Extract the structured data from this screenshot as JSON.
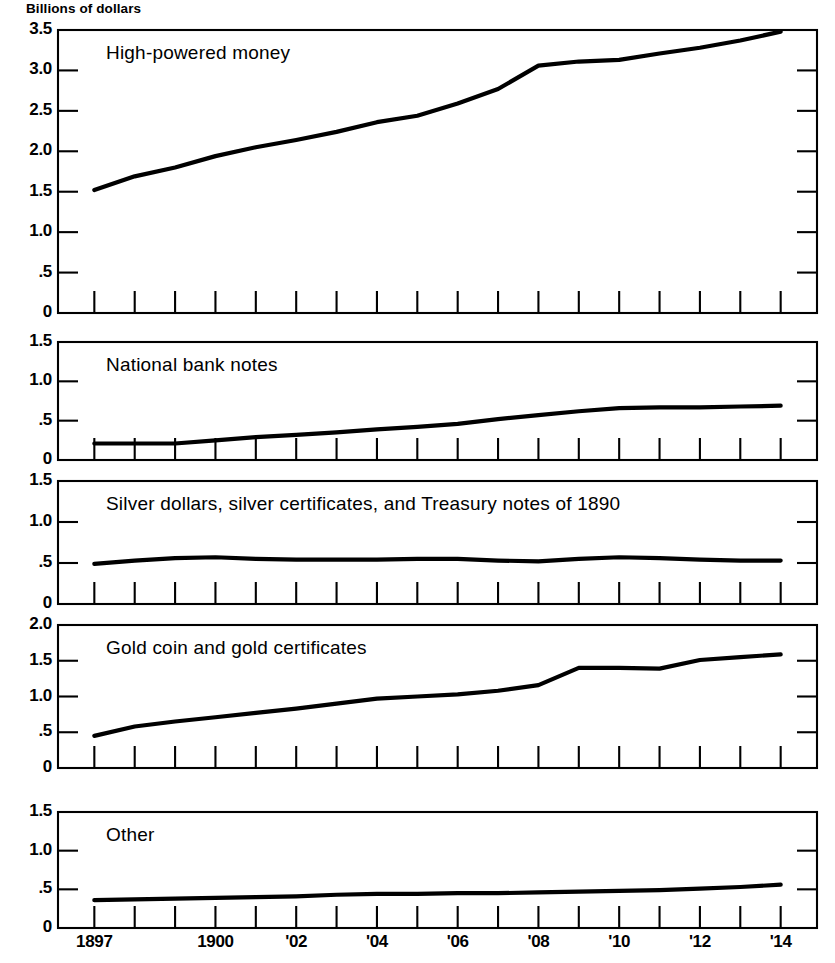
{
  "figure": {
    "unit_label": "Billions of dollars",
    "x_axis": {
      "tick_labels": [
        "1897",
        "1900",
        "'02",
        "'04",
        "'06",
        "'08",
        "'10",
        "'12",
        "'14"
      ],
      "tick_label_years": [
        1897,
        1900,
        1902,
        1904,
        1906,
        1908,
        1910,
        1912,
        1914
      ],
      "minor_tick_years": [
        1897,
        1898,
        1899,
        1900,
        1901,
        1902,
        1903,
        1904,
        1905,
        1906,
        1907,
        1908,
        1909,
        1910,
        1911,
        1912,
        1913,
        1914
      ],
      "range": [
        1896.1,
        1914.9
      ]
    },
    "line_color": "#000000",
    "background_color": "#ffffff"
  },
  "chart_data": [
    {
      "type": "line",
      "title": "High-powered money",
      "xlabel": "",
      "ylabel": "Billions of dollars",
      "xlim": [
        1896.1,
        1914.9
      ],
      "ylim": [
        0,
        3.5
      ],
      "grid": false,
      "legend": "none",
      "yticks": [
        0,
        0.5,
        1.0,
        1.5,
        2.0,
        2.5,
        3.0,
        3.5
      ],
      "ytick_labels": [
        "0",
        ".5",
        "1.0",
        "1.5",
        "2.0",
        "2.5",
        "3.0",
        "3.5"
      ],
      "x": [
        1897,
        1898,
        1899,
        1900,
        1901,
        1902,
        1903,
        1904,
        1905,
        1906,
        1907,
        1908,
        1909,
        1910,
        1911,
        1912,
        1913,
        1914
      ],
      "values": [
        1.52,
        1.69,
        1.8,
        1.94,
        2.05,
        2.14,
        2.24,
        2.36,
        2.44,
        2.59,
        2.77,
        3.06,
        3.11,
        3.13,
        3.21,
        3.28,
        3.37,
        3.48
      ]
    },
    {
      "type": "line",
      "title": "National bank notes",
      "xlabel": "",
      "ylabel": "",
      "xlim": [
        1896.1,
        1914.9
      ],
      "ylim": [
        0,
        1.5
      ],
      "grid": false,
      "legend": "none",
      "yticks": [
        0,
        0.5,
        1.0,
        1.5
      ],
      "ytick_labels": [
        "0",
        ".5",
        "1.0",
        "1.5"
      ],
      "x": [
        1897,
        1898,
        1899,
        1900,
        1901,
        1902,
        1903,
        1904,
        1905,
        1906,
        1907,
        1908,
        1909,
        1910,
        1911,
        1912,
        1913,
        1914
      ],
      "values": [
        0.21,
        0.21,
        0.21,
        0.25,
        0.29,
        0.32,
        0.35,
        0.39,
        0.42,
        0.46,
        0.52,
        0.57,
        0.62,
        0.66,
        0.67,
        0.67,
        0.68,
        0.69
      ]
    },
    {
      "type": "line",
      "title": "Silver dollars, silver certificates, and Treasury notes of 1890",
      "xlabel": "",
      "ylabel": "",
      "xlim": [
        1896.1,
        1914.9
      ],
      "ylim": [
        0,
        1.5
      ],
      "grid": false,
      "legend": "none",
      "yticks": [
        0,
        0.5,
        1.0,
        1.5
      ],
      "ytick_labels": [
        "0",
        ".5",
        "1.0",
        "1.5"
      ],
      "x": [
        1897,
        1898,
        1899,
        1900,
        1901,
        1902,
        1903,
        1904,
        1905,
        1906,
        1907,
        1908,
        1909,
        1910,
        1911,
        1912,
        1913,
        1914
      ],
      "values": [
        0.49,
        0.53,
        0.56,
        0.57,
        0.55,
        0.54,
        0.54,
        0.54,
        0.55,
        0.55,
        0.53,
        0.52,
        0.55,
        0.57,
        0.56,
        0.54,
        0.53,
        0.53,
        0.54
      ]
    },
    {
      "type": "line",
      "title": "Gold coin and gold certificates",
      "xlabel": "",
      "ylabel": "",
      "xlim": [
        1896.1,
        1914.9
      ],
      "ylim": [
        0,
        2.0
      ],
      "grid": false,
      "legend": "none",
      "yticks": [
        0,
        0.5,
        1.0,
        1.5,
        2.0
      ],
      "ytick_labels": [
        "0",
        ".5",
        "1.0",
        "1.5",
        "2.0"
      ],
      "x": [
        1897,
        1898,
        1899,
        1900,
        1901,
        1902,
        1903,
        1904,
        1905,
        1906,
        1907,
        1908,
        1909,
        1910,
        1911,
        1912,
        1913,
        1914
      ],
      "values": [
        0.45,
        0.58,
        0.65,
        0.71,
        0.77,
        0.83,
        0.9,
        0.97,
        1.0,
        1.03,
        1.08,
        1.16,
        1.4,
        1.4,
        1.39,
        1.51,
        1.55,
        1.59,
        1.63
      ]
    },
    {
      "type": "line",
      "title": "Other",
      "xlabel": "",
      "ylabel": "",
      "xlim": [
        1896.1,
        1914.9
      ],
      "ylim": [
        0,
        1.5
      ],
      "grid": false,
      "legend": "none",
      "yticks": [
        0,
        0.5,
        1.0,
        1.5
      ],
      "ytick_labels": [
        "0",
        ".5",
        "1.0",
        "1.5"
      ],
      "x": [
        1897,
        1898,
        1899,
        1900,
        1901,
        1902,
        1903,
        1904,
        1905,
        1906,
        1907,
        1908,
        1909,
        1910,
        1911,
        1912,
        1913,
        1914
      ],
      "values": [
        0.36,
        0.37,
        0.38,
        0.39,
        0.4,
        0.41,
        0.43,
        0.44,
        0.44,
        0.45,
        0.45,
        0.46,
        0.47,
        0.48,
        0.49,
        0.51,
        0.53,
        0.56
      ]
    }
  ]
}
